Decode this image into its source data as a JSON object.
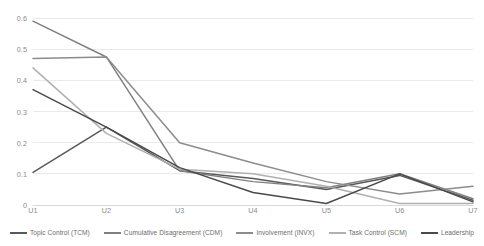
{
  "chart_data": {
    "type": "line",
    "title": "",
    "xlabel": "",
    "ylabel": "",
    "categories": [
      "U1",
      "U2",
      "U3",
      "U4",
      "U5",
      "U6",
      "U7"
    ],
    "ylim": [
      0,
      0.6
    ],
    "ytick_labels": [
      "0",
      "0.1",
      "0.2",
      "0.3",
      "0.4",
      "0.5",
      "0.6"
    ],
    "ytick_values": [
      0,
      0.1,
      0.2,
      0.3,
      0.4,
      0.5,
      0.6
    ],
    "grid": "horizontal",
    "legend_position": "bottom",
    "series": [
      {
        "name": "Topic Control (TCM)",
        "color": "#595959",
        "values": [
          0.105,
          0.25,
          0.11,
          0.085,
          0.05,
          0.095,
          0.015
        ]
      },
      {
        "name": "Cumulative Disagreement (CDM)",
        "color": "#808080",
        "values": [
          0.59,
          0.475,
          0.11,
          0.075,
          0.055,
          0.1,
          0.02
        ]
      },
      {
        "name": "Involvement (INVX)",
        "color": "#8c8c8c",
        "values": [
          0.47,
          0.475,
          0.2,
          0.135,
          0.075,
          0.035,
          0.06
        ]
      },
      {
        "name": "Task Control (SCM)",
        "color": "#b0b0b0",
        "values": [
          0.44,
          0.23,
          0.115,
          0.1,
          0.06,
          0.005,
          0.005
        ]
      },
      {
        "name": "Leadership",
        "color": "#4a4a4a",
        "values": [
          0.37,
          0.25,
          0.12,
          0.04,
          0.005,
          0.1,
          0.01
        ]
      }
    ],
    "axis_color": "#d9d9d9",
    "grid_color": "#e8e8e8",
    "tick_text_color": "#8a8a8a"
  }
}
